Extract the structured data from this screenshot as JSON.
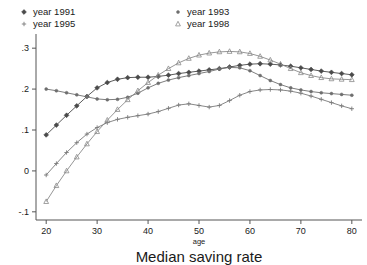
{
  "chart_data": {
    "type": "line",
    "title": "Median saving rate",
    "xlabel": "age",
    "ylabel": "",
    "xlim": [
      18,
      82
    ],
    "ylim": [
      -0.12,
      0.32
    ],
    "grid": false,
    "legend_position": "top",
    "xticks": [
      20,
      30,
      40,
      50,
      60,
      70,
      80
    ],
    "xtick_labels": [
      "20",
      "30",
      "40",
      "50",
      "60",
      "70",
      "80"
    ],
    "yticks": [
      -0.1,
      0,
      0.1,
      0.2,
      0.3
    ],
    "ytick_labels": [
      "-.1",
      "0",
      ".1",
      ".2",
      ".3"
    ],
    "x": [
      20,
      22,
      24,
      26,
      28,
      30,
      32,
      34,
      36,
      38,
      40,
      42,
      44,
      46,
      48,
      50,
      52,
      54,
      56,
      58,
      60,
      62,
      64,
      66,
      68,
      70,
      72,
      74,
      76,
      78,
      80
    ],
    "series": [
      {
        "name": "year 1991",
        "marker": "diamond",
        "color": "#4a4a4a",
        "values": [
          0.088,
          0.112,
          0.136,
          0.159,
          0.182,
          0.203,
          0.216,
          0.224,
          0.228,
          0.229,
          0.229,
          0.231,
          0.234,
          0.238,
          0.241,
          0.244,
          0.247,
          0.25,
          0.254,
          0.258,
          0.261,
          0.262,
          0.261,
          0.259,
          0.256,
          0.252,
          0.248,
          0.244,
          0.241,
          0.238,
          0.235
        ]
      },
      {
        "name": "year 1993",
        "marker": "dot",
        "color": "#6e6e6e",
        "values": [
          0.2,
          0.196,
          0.191,
          0.186,
          0.181,
          0.176,
          0.174,
          0.175,
          0.18,
          0.19,
          0.203,
          0.214,
          0.222,
          0.228,
          0.233,
          0.238,
          0.243,
          0.249,
          0.253,
          0.252,
          0.245,
          0.233,
          0.221,
          0.211,
          0.203,
          0.198,
          0.194,
          0.191,
          0.189,
          0.187,
          0.185
        ]
      },
      {
        "name": "year 1995",
        "marker": "plus",
        "color": "#7a7a7a",
        "values": [
          -0.01,
          0.018,
          0.045,
          0.069,
          0.09,
          0.106,
          0.118,
          0.126,
          0.131,
          0.135,
          0.139,
          0.145,
          0.153,
          0.161,
          0.164,
          0.16,
          0.156,
          0.16,
          0.172,
          0.185,
          0.194,
          0.198,
          0.199,
          0.198,
          0.195,
          0.19,
          0.183,
          0.175,
          0.167,
          0.159,
          0.152
        ]
      },
      {
        "name": "year 1998",
        "marker": "triangle",
        "color": "#8a8a8a",
        "values": [
          -0.075,
          -0.036,
          0.0,
          0.034,
          0.066,
          0.096,
          0.124,
          0.15,
          0.174,
          0.196,
          0.216,
          0.234,
          0.25,
          0.264,
          0.275,
          0.283,
          0.288,
          0.291,
          0.292,
          0.291,
          0.287,
          0.28,
          0.271,
          0.261,
          0.25,
          0.24,
          0.233,
          0.228,
          0.225,
          0.224,
          0.223
        ]
      }
    ]
  },
  "legend": {
    "entries": [
      {
        "label": "year 1991"
      },
      {
        "label": "year 1993"
      },
      {
        "label": "year 1995"
      },
      {
        "label": "year 1998"
      }
    ]
  }
}
